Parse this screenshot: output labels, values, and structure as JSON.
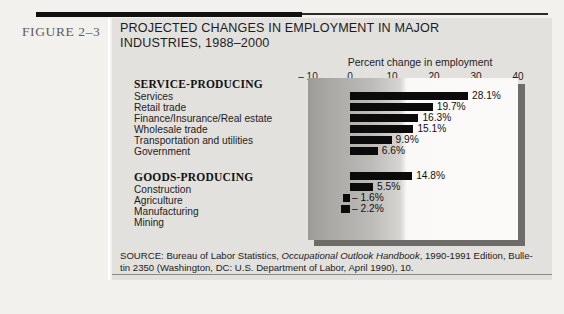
{
  "figure": {
    "number_label": "FIGURE 2–3",
    "title_line1": "PROJECTED CHANGES IN EMPLOYMENT IN MAJOR",
    "title_line2": "INDUSTRIES, 1988–2000"
  },
  "source": {
    "line1_prefix": "SOURCE: Bureau of Labor Statistics, ",
    "line1_italic": "Occupational Outlook Handbook",
    "line1_suffix": ", 1990-1991 Edition, Bulle-",
    "line2": "tin 2350 (Washington, DC: U.S. Department of Labor, April 1990), 10."
  },
  "groups": [
    {
      "heading": "SERVICE-PRODUCING"
    },
    {
      "heading": "GOODS-PRODUCING"
    }
  ],
  "axis": {
    "caption": "Percent change in employment",
    "ticks": [
      "– 10",
      "0",
      "10",
      "20",
      "30",
      "40"
    ],
    "tick_values": [
      -10,
      0,
      10,
      20,
      30,
      40
    ]
  },
  "chart_data": {
    "type": "bar",
    "orientation": "horizontal",
    "title": "PROJECTED CHANGES IN EMPLOYMENT IN MAJOR INDUSTRIES, 1988–2000",
    "xlabel": "Percent change in employment",
    "ylabel": "",
    "xlim": [
      -10,
      40
    ],
    "xticks": [
      -10,
      0,
      10,
      20,
      30,
      40
    ],
    "grid": false,
    "legend": "none",
    "categories": [
      "Services",
      "Retail trade",
      "Finance/Insurance/Real estate",
      "Wholesale trade",
      "Transportation and utilities",
      "Government",
      "Construction",
      "Agriculture",
      "Manufacturing",
      "Mining"
    ],
    "values": [
      28.1,
      19.7,
      16.3,
      15.1,
      9.9,
      6.6,
      14.8,
      5.5,
      -1.6,
      -2.2
    ],
    "value_labels": [
      "28.1%",
      "19.7%",
      "16.3%",
      "15.1%",
      "9.9%",
      "6.6%",
      "14.8%",
      "5.5%",
      "– 1.6%",
      "– 2.2%"
    ],
    "groups": [
      {
        "name": "SERVICE-PRODUCING",
        "categories": [
          "Services",
          "Retail trade",
          "Finance/Insurance/Real estate",
          "Wholesale trade",
          "Transportation and utilities",
          "Government"
        ]
      },
      {
        "name": "GOODS-PRODUCING",
        "categories": [
          "Construction",
          "Agriculture",
          "Manufacturing",
          "Mining"
        ]
      }
    ],
    "bar_color": "#0b0b0b",
    "panel_color": "#faf9f7"
  }
}
